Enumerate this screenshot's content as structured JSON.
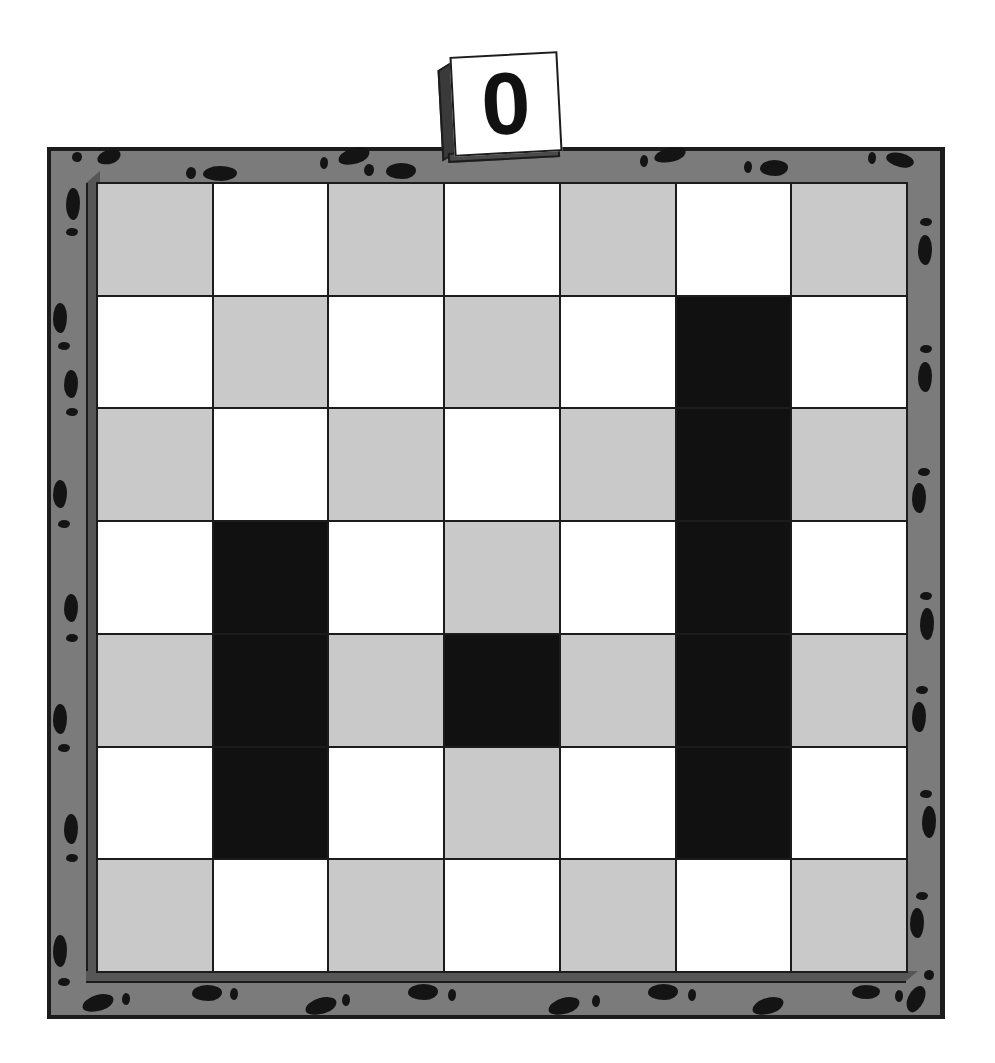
{
  "score": {
    "value": "0"
  },
  "board": {
    "rows": 7,
    "cols": 7,
    "colors": {
      "frame": "#7b7b7b",
      "light": "#c9c9c9",
      "white": "#ffffff",
      "block": "#111111",
      "line": "#1c1c1c"
    },
    "cells": [
      [
        "gray",
        "white",
        "gray",
        "white",
        "gray",
        "white",
        "gray"
      ],
      [
        "white",
        "gray",
        "white",
        "gray",
        "white",
        "block",
        "white"
      ],
      [
        "gray",
        "white",
        "gray",
        "white",
        "gray",
        "block",
        "gray"
      ],
      [
        "white",
        "block",
        "white",
        "gray",
        "white",
        "block",
        "white"
      ],
      [
        "gray",
        "block",
        "gray",
        "block",
        "gray",
        "block",
        "gray"
      ],
      [
        "white",
        "block",
        "white",
        "gray",
        "white",
        "block",
        "white"
      ],
      [
        "gray",
        "white",
        "gray",
        "white",
        "gray",
        "white",
        "gray"
      ]
    ]
  }
}
